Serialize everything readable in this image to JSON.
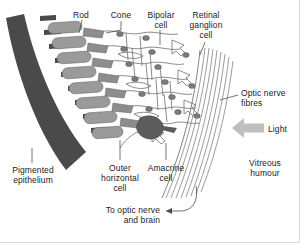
{
  "figure": {
    "background": "#ffffff",
    "border_color": "#d9d9d9",
    "width": 300,
    "height": 243
  },
  "palette": {
    "ink": "#1b1b1b",
    "pigment_dark": "#4a4a4a",
    "rod_fill": "#9a9a9a",
    "cone_fill": "#8d8d8d",
    "cell_outline": "#6e6e6e",
    "nucleus": "#7a7a7a",
    "amacrine_fill": "#5c5c5c",
    "fibre_line": "#8a8a8a",
    "light_arrow": "#bfbfbf",
    "leader": "#4a4a4a"
  },
  "labels": {
    "rod": "Rod",
    "cone": "Cone",
    "bipolar_cell": "Bipolar\ncell",
    "retinal_ganglion_cell": "Retinal\nganglion\ncell",
    "optic_nerve_fibres": "Optic nerve\nfibres",
    "light": "Light",
    "vitreous_humour": "Vitreous\nhumour",
    "pigmented_epithelium": "Pigmented\nepithelium",
    "outer_horizontal_cell": "Outer\nhorizontal\ncell",
    "amacrine_cell": "Amacrine\ncell",
    "to_optic_nerve_and_brain": "To optic nerve\nand brain"
  },
  "structures": [
    {
      "name": "pigmented-epithelium",
      "description": "dark curved comb-like band at left"
    },
    {
      "name": "rod-cells",
      "description": "elongated grey capsules in a row"
    },
    {
      "name": "cone-cells",
      "description": "tapered grey cells between rods"
    },
    {
      "name": "bipolar-cells",
      "description": "outlined cells with nuclei in middle layer"
    },
    {
      "name": "outer-horizontal-cells",
      "description": "horizontally oriented cells"
    },
    {
      "name": "amacrine-cell",
      "description": "dark filled cell near inner layer"
    },
    {
      "name": "retinal-ganglion-cells",
      "description": "cells adjoining the nerve fibre layer"
    },
    {
      "name": "optic-nerve-fibre-bundle",
      "description": "diagonal band of parallel fibres"
    },
    {
      "name": "light-arrow",
      "description": "grey block arrow pointing left"
    }
  ]
}
